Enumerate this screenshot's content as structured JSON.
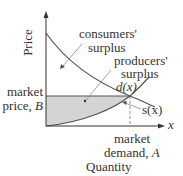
{
  "diagram": {
    "type": "economics supply-demand surplus diagram",
    "axes": {
      "y_label": "Price",
      "x_label": "Quantity",
      "x_axis_symbol": "x"
    },
    "curves": {
      "demand_label": "d(x)",
      "supply_label": "s(x)"
    },
    "regions": {
      "consumers_surplus_line1": "consumers'",
      "consumers_surplus_line2": "surplus",
      "producers_surplus_line1": "producers'",
      "producers_surplus_line2": "surplus"
    },
    "markers": {
      "market_price_line1": "market",
      "market_price_line2": "price, B",
      "market_price_prefix": "price, ",
      "market_price_symbol": "B",
      "market_demand_line1": "market",
      "market_demand_prefix": "demand, ",
      "market_demand_symbol": "A"
    },
    "colors": {
      "axis": "#333333",
      "curve": "#555555",
      "shade": "#d4d4d4",
      "pointer": "#888888"
    }
  }
}
